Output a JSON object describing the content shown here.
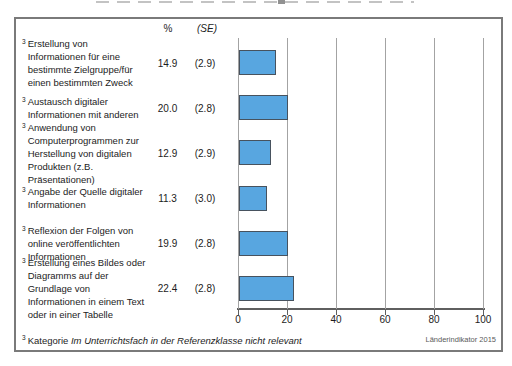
{
  "table": {
    "value_header": "%",
    "se_header": "(SE)",
    "rows": [
      {
        "sup": "3",
        "label_lines": [
          "Erstellung von",
          "Informationen für eine",
          "bestimmte Zielgruppe/für",
          "einen bestimmten Zweck"
        ],
        "value": "14.9",
        "se": "(2.9)",
        "value_num": 14.9
      },
      {
        "sup": "3",
        "label_lines": [
          "Austausch digitaler",
          "Informationen mit anderen"
        ],
        "value": "20.0",
        "se": "(2.8)",
        "value_num": 20.0
      },
      {
        "sup": "3",
        "label_lines": [
          "Anwendung von",
          "Computerprogrammen zur",
          "Herstellung von digitalen",
          "Produkten (z.B.",
          "Präsentationen)"
        ],
        "value": "12.9",
        "se": "(2.9)",
        "value_num": 12.9
      },
      {
        "sup": "3",
        "label_lines": [
          "Angabe der Quelle digitaler",
          "Informationen"
        ],
        "value": "11.3",
        "se": "(3.0)",
        "value_num": 11.3
      },
      {
        "sup": "3",
        "label_lines": [
          "Reflexion der Folgen von",
          "online veröffentlichten",
          "Informationen"
        ],
        "value": "19.9",
        "se": "(2.8)",
        "value_num": 19.9
      },
      {
        "sup": "3",
        "label_lines": [
          "Erstellung eines Bildes oder",
          "Diagramms auf der",
          "Grundlage von",
          "Informationen in einem Text",
          "oder in einer Tabelle"
        ],
        "value": "22.4",
        "se": "(2.8)",
        "value_num": 22.4
      }
    ]
  },
  "footnote": {
    "sup": "3",
    "regular": "Kategorie ",
    "italic": "Im Unterrichtsfach in der Referenzklasse nicht relevant"
  },
  "source_label": "Länderindikator 2015",
  "chart_data": {
    "type": "bar",
    "orientation": "horizontal",
    "title": "",
    "xlabel": "",
    "ylabel": "",
    "categories": [
      "Erstellung von Informationen für eine bestimmte Zielgruppe/für einen bestimmten Zweck",
      "Austausch digitaler Informationen mit anderen",
      "Anwendung von Computerprogrammen zur Herstellung von digitalen Produkten (z.B. Präsentationen)",
      "Angabe der Quelle digitaler Informationen",
      "Reflexion der Folgen von online veröffentlichten Informationen",
      "Erstellung eines Bildes oder Diagramms auf der Grundlage von Informationen in einem Text oder in einer Tabelle"
    ],
    "category_footnote_marker": "3",
    "series": [
      {
        "name": "%",
        "values": [
          14.9,
          20.0,
          12.9,
          11.3,
          19.9,
          22.4
        ]
      },
      {
        "name": "(SE)",
        "values": [
          2.9,
          2.8,
          2.9,
          3.0,
          2.8,
          2.8
        ]
      }
    ],
    "xlim": [
      0,
      100
    ],
    "xticks": [
      0,
      20,
      40,
      60,
      80,
      100
    ],
    "grid": "vertical",
    "legend": "none",
    "bar_color": "#58a6e0",
    "bar_border_color": "#47525e",
    "footnote": "3 Kategorie Im Unterrichtsfach in der Referenzklasse nicht relevant",
    "source": "Länderindikator 2015"
  }
}
